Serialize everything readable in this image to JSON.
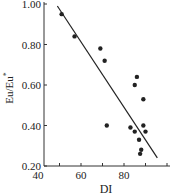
{
  "chart_data": {
    "type": "scatter",
    "title": "",
    "xlabel": "DI",
    "ylabel": "Eu/Eu*",
    "xlim": [
      40,
      100
    ],
    "ylim": [
      0.2,
      1.0
    ],
    "x_ticks": [
      40,
      60,
      80
    ],
    "x_tick_labels": [
      "40",
      "60",
      "80"
    ],
    "y_ticks": [
      0.2,
      0.4,
      0.6,
      0.8,
      1.0
    ],
    "y_tick_labels": [
      "0.20",
      "0.40",
      "0.60",
      "0.80",
      "1.00"
    ],
    "grid": false,
    "legend": null,
    "series": [
      {
        "name": "samples",
        "points": [
          {
            "x": 51,
            "y": 0.95
          },
          {
            "x": 57,
            "y": 0.84
          },
          {
            "x": 69,
            "y": 0.78
          },
          {
            "x": 71,
            "y": 0.72
          },
          {
            "x": 72,
            "y": 0.4
          },
          {
            "x": 86,
            "y": 0.64
          },
          {
            "x": 85,
            "y": 0.6
          },
          {
            "x": 89,
            "y": 0.53
          },
          {
            "x": 83,
            "y": 0.39
          },
          {
            "x": 85,
            "y": 0.37
          },
          {
            "x": 89,
            "y": 0.4
          },
          {
            "x": 90,
            "y": 0.37
          },
          {
            "x": 87,
            "y": 0.33
          },
          {
            "x": 88,
            "y": 0.28
          },
          {
            "x": 87.5,
            "y": 0.26
          }
        ]
      }
    ],
    "trendline": {
      "x1": 49,
      "y1": 0.99,
      "x2": 95.5,
      "y2": 0.24
    }
  }
}
